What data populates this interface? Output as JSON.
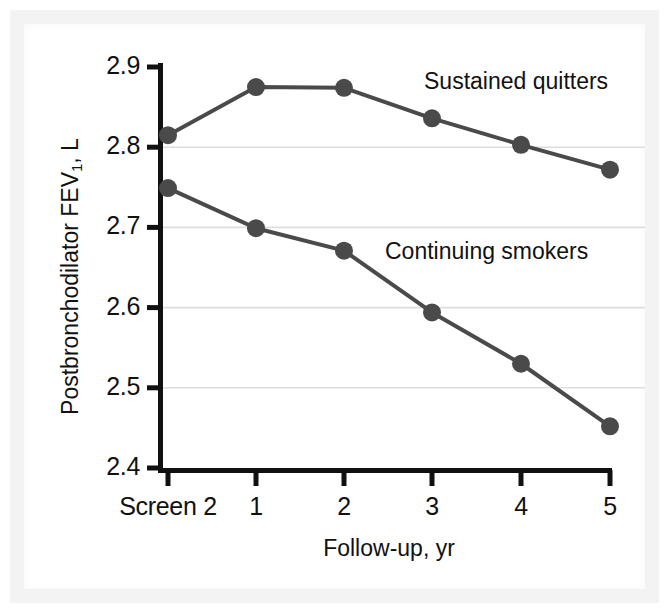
{
  "chart_data": {
    "type": "line",
    "title": "",
    "xlabel": "Follow-up, yr",
    "ylabel": "Postbronchodilator FEV1, L",
    "ylabel_main": "Postbronchodilator FEV",
    "ylabel_sub": "1",
    "ylabel_tail": ", L",
    "categories": [
      "Screen 2",
      "1",
      "2",
      "3",
      "4",
      "5"
    ],
    "ylim": [
      2.4,
      2.9
    ],
    "yticks": [
      "2.9",
      "2.8",
      "2.7",
      "2.6",
      "2.5",
      "2.4"
    ],
    "ytick_values": [
      2.9,
      2.8,
      2.7,
      2.6,
      2.5,
      2.4
    ],
    "gridlines_at": [
      2.8,
      2.7,
      2.6,
      2.5
    ],
    "grid": true,
    "legend_position": "inline-annotations",
    "series": [
      {
        "name": "Sustained quitters",
        "values": [
          2.815,
          2.875,
          2.874,
          2.836,
          2.803,
          2.772
        ],
        "color": "#4a4a4a"
      },
      {
        "name": "Continuing smokers",
        "values": [
          2.749,
          2.699,
          2.671,
          2.594,
          2.53,
          2.452
        ],
        "color": "#4a4a4a"
      }
    ],
    "annotations": [
      {
        "text": "Sustained quitters",
        "x": 424,
        "y": 68
      },
      {
        "text": "Continuing smokers",
        "x": 385,
        "y": 238
      }
    ],
    "colors": {
      "line": "#4a4a4a",
      "marker": "#4a4a4a",
      "axis": "#111111",
      "grid": "#dddddd",
      "text": "#111111",
      "background": "#ffffff"
    }
  }
}
